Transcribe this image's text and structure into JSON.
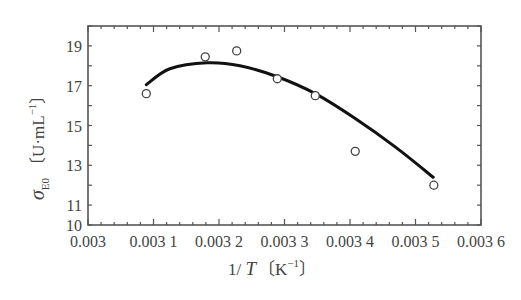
{
  "chart_data": {
    "type": "scatter",
    "title": "",
    "xlabel": "1/ T (K⁻¹)",
    "ylabel": "σE0 (U·mL⁻¹)",
    "xlim": [
      0.003,
      0.0036
    ],
    "ylim": [
      10,
      20
    ],
    "x_ticks": [
      "0.003",
      "0.003 1",
      "0.003 2",
      "0.003 3",
      "0.003 4",
      "0.003 5",
      "0.003 6"
    ],
    "y_ticks": [
      "10",
      "11",
      "13",
      "15",
      "17",
      "19"
    ],
    "grid": false,
    "legend": null,
    "series": [
      {
        "name": "measured",
        "type": "scatter",
        "marker": "open-circle",
        "x": [
          0.003089,
          0.003179,
          0.003227,
          0.003289,
          0.003347,
          0.003408,
          0.003528
        ],
        "y": [
          16.6,
          18.45,
          18.75,
          17.35,
          16.5,
          13.7,
          12.0
        ]
      },
      {
        "name": "fitted curve",
        "type": "line",
        "x": [
          0.003089,
          0.003125,
          0.003182,
          0.003232,
          0.003289,
          0.003347,
          0.003408,
          0.00347,
          0.003527
        ],
        "y": [
          17.05,
          17.85,
          18.15,
          18.0,
          17.45,
          16.6,
          15.35,
          13.9,
          12.4
        ]
      }
    ]
  },
  "labels": {
    "y_sigma": "σ",
    "y_sub": "E0",
    "y_units": "〔U·mL",
    "y_sup": "−1",
    "y_close": "〕",
    "x_main": "1/ ",
    "x_T": "T",
    "x_units": "〔K",
    "x_sup": "−1",
    "x_close": "〕"
  }
}
